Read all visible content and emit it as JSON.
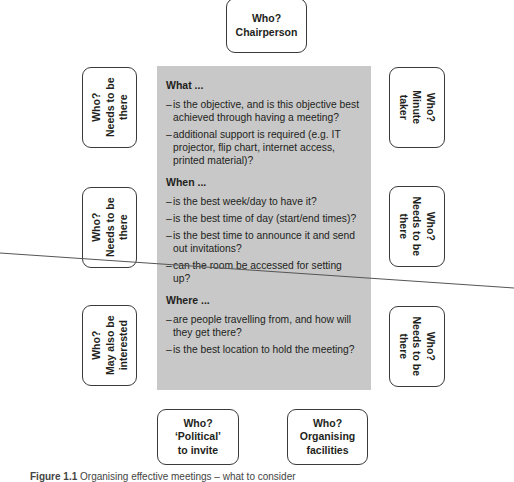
{
  "diagram": {
    "top": {
      "lines": [
        "Who?",
        "Chairperson"
      ]
    },
    "left": [
      {
        "lines": [
          "Who?",
          "Needs to be",
          "there"
        ]
      },
      {
        "lines": [
          "Who?",
          "Needs to be",
          "there"
        ]
      },
      {
        "lines": [
          "Who?",
          "May also be",
          "interested"
        ]
      }
    ],
    "right": [
      {
        "lines": [
          "Who?",
          "Minute",
          "taker"
        ]
      },
      {
        "lines": [
          "Who?",
          "Needs to be",
          "there"
        ]
      },
      {
        "lines": [
          "Who?",
          "Needs to be",
          "there"
        ]
      }
    ],
    "bottom": [
      {
        "lines": [
          "Who?",
          "‘Political’",
          "to invite"
        ]
      },
      {
        "lines": [
          "Who?",
          "Organising",
          "facilities"
        ]
      }
    ],
    "center": {
      "sections": [
        {
          "heading": "What ...",
          "items": [
            "is the objective, and is this objective best achieved through having a meeting?",
            "additional support is required (e.g. IT projector, flip chart, internet access, printed material)?"
          ]
        },
        {
          "heading": "When ...",
          "items": [
            "is the best week/day to have it?",
            "is the best time of day (start/end times)?",
            "is the best time to announce it and send out invitations?",
            "can the room be accessed for setting up?"
          ]
        },
        {
          "heading": "Where ...",
          "items": [
            "are people travelling from, and how will they get there?",
            "is the best location to hold the meeting?"
          ]
        }
      ]
    }
  },
  "caption": {
    "label": "Figure 1.1",
    "text": "Organising effective meetings – what to consider"
  },
  "colors": {
    "center_fill": "#c8c8c8",
    "box_border": "#3a3a3a",
    "line": "#555555"
  }
}
